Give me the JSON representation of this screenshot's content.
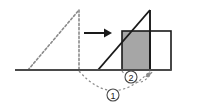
{
  "figure": {
    "canvas": {
      "width": 197,
      "height": 107,
      "background": "#ffffff"
    },
    "colors": {
      "stroke_solid": "#1a1a1a",
      "stroke_dashed": "#8a8a8a",
      "baseline": "#4a4a4a",
      "shaded_fill": "#a6a6a6",
      "white_fill": "#ffffff",
      "label_text": "#1a1a1a"
    },
    "baseline": {
      "x1": 15,
      "y1": 70,
      "x2": 171,
      "y2": 70
    },
    "dashed_triangle": {
      "name": "original-triangle",
      "style": "dashed",
      "vertices": [
        {
          "x": 28,
          "y": 70
        },
        {
          "x": 79,
          "y": 10
        },
        {
          "x": 79,
          "y": 70
        }
      ]
    },
    "transform_arrow": {
      "name": "transform-arrow",
      "direction": "right",
      "x1": 84,
      "y1": 33,
      "x2": 108,
      "y2": 33
    },
    "solid_triangle": {
      "name": "transformed-triangle",
      "style": "solid",
      "vertices": [
        {
          "x": 98,
          "y": 70
        },
        {
          "x": 150,
          "y": 10
        },
        {
          "x": 150,
          "y": 70
        }
      ]
    },
    "shaded_square": {
      "name": "shaded-square",
      "x": 122,
      "y": 31,
      "width": 28,
      "height": 39,
      "fill": "#a6a6a6"
    },
    "white_rectangle": {
      "name": "white-rectangle",
      "x": 150,
      "y": 31,
      "width": 21,
      "height": 39,
      "fill": "#ffffff"
    },
    "callouts": [
      {
        "id": "callout-1",
        "label": "1",
        "arc": {
          "x_start": 79,
          "y_start": 71,
          "x_end": 150,
          "y_end": 71,
          "dip": 26
        },
        "label_x": 113,
        "label_y": 95,
        "radius": 6
      },
      {
        "id": "callout-2",
        "label": "2",
        "arc": {
          "x_start": 122,
          "y_start": 71,
          "x_end": 152,
          "y_end": 71,
          "dip": 14
        },
        "label_x": 131,
        "label_y": 77,
        "radius": 6
      }
    ]
  }
}
